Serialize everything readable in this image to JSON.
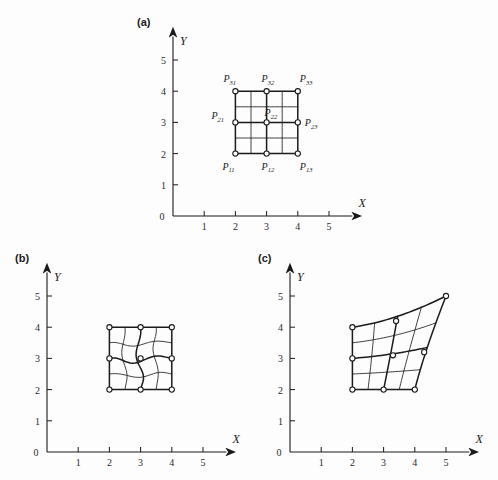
{
  "figure": {
    "background": "#fdfdfd",
    "ink": "#1a1a1a"
  },
  "axes": {
    "x_label": "X",
    "y_label": "Y",
    "x_ticks": [
      "1",
      "2",
      "3",
      "4",
      "5"
    ],
    "y_ticks": [
      "1",
      "2",
      "3",
      "4",
      "5"
    ],
    "origin_label": "0"
  },
  "panels": [
    {
      "id": "a",
      "label": "(a)",
      "caption_points_shown": true,
      "point_labels": [
        {
          "text": "P",
          "sub": "31",
          "gx": 2,
          "gy": 4,
          "anchor": "top-left"
        },
        {
          "text": "P",
          "sub": "32",
          "gx": 3,
          "gy": 4,
          "anchor": "top-center"
        },
        {
          "text": "P",
          "sub": "33",
          "gx": 4,
          "gy": 4,
          "anchor": "top-right"
        },
        {
          "text": "P",
          "sub": "21",
          "gx": 2,
          "gy": 3,
          "anchor": "left"
        },
        {
          "text": "P",
          "sub": "22",
          "gx": 3,
          "gy": 3,
          "anchor": "up-right"
        },
        {
          "text": "P",
          "sub": "23",
          "gx": 4,
          "gy": 3,
          "anchor": "right"
        },
        {
          "text": "P",
          "sub": "11",
          "gx": 2,
          "gy": 2,
          "anchor": "bottom-left"
        },
        {
          "text": "P",
          "sub": "12",
          "gx": 3,
          "gy": 2,
          "anchor": "bottom-center"
        },
        {
          "text": "P",
          "sub": "13",
          "gx": 4,
          "gy": 2,
          "anchor": "bottom-right"
        }
      ]
    },
    {
      "id": "b",
      "label": "(b)",
      "caption_points_shown": false,
      "point_labels": []
    },
    {
      "id": "c",
      "label": "(c)",
      "caption_points_shown": false,
      "point_labels": []
    }
  ],
  "chart_data": {
    "type": "line",
    "title": "",
    "xlabel": "X",
    "ylabel": "Y",
    "xlim": [
      0,
      5.6
    ],
    "ylim": [
      0,
      5.6
    ],
    "grid": false,
    "legend": "none",
    "panels": [
      {
        "id": "a",
        "name": "undeformed control grid",
        "control_points": [
          [
            [
              2,
              2
            ],
            [
              3,
              2
            ],
            [
              4,
              2
            ]
          ],
          [
            [
              2,
              3
            ],
            [
              3,
              3
            ],
            [
              4,
              3
            ]
          ],
          [
            [
              2,
              4
            ],
            [
              3,
              4
            ],
            [
              4,
              4
            ]
          ]
        ],
        "mesh_u": [
          2,
          2.5,
          3,
          3.5,
          4
        ],
        "mesh_v": [
          2,
          2.5,
          3,
          3.5,
          4
        ],
        "mesh_shape": "rectilinear"
      },
      {
        "id": "b",
        "name": "warped patch, straight boundary",
        "control_points": [
          [
            [
              2,
              2
            ],
            [
              3,
              2
            ],
            [
              4,
              2
            ]
          ],
          [
            [
              2,
              3
            ],
            [
              3,
              3
            ],
            [
              4,
              3
            ]
          ],
          [
            [
              2,
              4
            ],
            [
              3,
              4
            ],
            [
              4,
              4
            ]
          ]
        ],
        "mesh_u": [
          2,
          2.5,
          3,
          3.5,
          4
        ],
        "mesh_v": [
          2,
          2.5,
          3,
          3.5,
          4
        ],
        "mesh_shape": "sinusoidal-interior",
        "warp_amplitude": 0.16
      },
      {
        "id": "c",
        "name": "sheared and stretched patch",
        "control_points": [
          [
            [
              2,
              2
            ],
            [
              3,
              2
            ],
            [
              4,
              2
            ]
          ],
          [
            [
              2,
              3
            ],
            [
              3.3,
              3.1
            ],
            [
              4.3,
              3.2
            ]
          ],
          [
            [
              2,
              4
            ],
            [
              3.4,
              4.2
            ],
            [
              5,
              5
            ]
          ]
        ],
        "mesh_u": [
          2,
          2.5,
          3,
          3.5,
          4
        ],
        "mesh_v": [
          2,
          2.5,
          3,
          3.5,
          4
        ],
        "mesh_shape": "bilinear-warp"
      }
    ]
  }
}
